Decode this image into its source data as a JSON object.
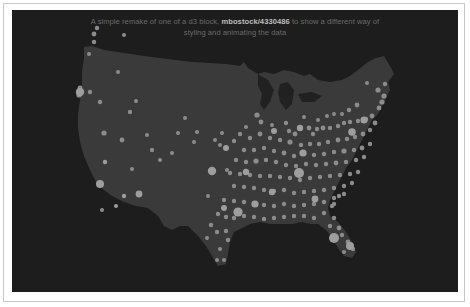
{
  "caption": {
    "before": "A simple remake of one of a d3 block, ",
    "link": "mbostock/4330486",
    "after": " to show a different way of",
    "line2": "styling and animating the data"
  },
  "colors": {
    "panel_bg": "#1d1d1d",
    "land": "#3a3a3a",
    "dot": "#8c8c8c",
    "dot_bright": "#9e9e9e",
    "caption_text": "#6a6a6a",
    "caption_link": "#bdbdbd"
  },
  "map": {
    "type": "hexbin-dot-map",
    "region": "United States (contiguous)",
    "dots": [
      [
        85,
        18,
        2.2
      ],
      [
        82,
        24,
        2.4
      ],
      [
        82,
        32,
        2.2
      ],
      [
        77,
        44,
        2.0
      ],
      [
        112,
        25,
        2.0
      ],
      [
        106,
        62,
        2.0
      ],
      [
        68,
        78,
        2.4
      ],
      [
        67,
        85,
        2.6
      ],
      [
        78,
        82,
        2.2
      ],
      [
        88,
        92,
        2.2
      ],
      [
        110,
        130,
        2.4
      ],
      [
        135,
        125,
        2.0
      ],
      [
        148,
        150,
        2.0
      ],
      [
        166,
        123,
        2.0
      ],
      [
        120,
        159,
        2.0
      ],
      [
        90,
        200,
        2.0
      ],
      [
        124,
        91,
        2.0
      ],
      [
        92,
        123,
        2.6
      ],
      [
        118,
        102,
        2.2
      ],
      [
        140,
        140,
        2.2
      ],
      [
        160,
        143,
        2.0
      ],
      [
        173,
        108,
        2.0
      ],
      [
        182,
        132,
        2.0
      ],
      [
        185,
        122,
        2.0
      ],
      [
        210,
        123,
        2.0
      ],
      [
        203,
        130,
        2.0
      ],
      [
        208,
        135,
        2.0
      ],
      [
        215,
        160,
        2.0
      ],
      [
        245,
        105,
        2.6
      ],
      [
        249,
        112,
        2.4
      ],
      [
        260,
        115,
        2.0
      ],
      [
        274,
        113,
        2.2
      ],
      [
        277,
        121,
        2.2
      ],
      [
        283,
        124,
        2.4
      ],
      [
        292,
        107,
        2.0
      ],
      [
        297,
        118,
        2.4
      ],
      [
        301,
        124,
        2.2
      ],
      [
        305,
        119,
        2.2
      ],
      [
        311,
        118,
        2.4
      ],
      [
        318,
        118,
        2.2
      ],
      [
        326,
        116,
        2.2
      ],
      [
        332,
        113,
        2.2
      ],
      [
        338,
        112,
        2.2
      ],
      [
        346,
        111,
        2.2
      ],
      [
        354,
        109,
        2.2
      ],
      [
        360,
        106,
        2.4
      ],
      [
        367,
        98,
        2.4
      ],
      [
        370,
        92,
        2.6
      ],
      [
        372,
        86,
        2.6
      ],
      [
        366,
        80,
        2.6
      ],
      [
        373,
        74,
        2.2
      ],
      [
        355,
        73,
        2.0
      ],
      [
        345,
        95,
        2.4
      ],
      [
        337,
        100,
        2.2
      ],
      [
        330,
        104,
        2.0
      ],
      [
        322,
        104,
        2.0
      ],
      [
        315,
        106,
        2.0
      ],
      [
        306,
        110,
        2.0
      ],
      [
        234,
        117,
        2.0
      ],
      [
        228,
        124,
        2.2
      ],
      [
        222,
        131,
        2.2
      ],
      [
        238,
        128,
        2.2
      ],
      [
        248,
        124,
        2.4
      ],
      [
        258,
        128,
        2.2
      ],
      [
        268,
        130,
        2.2
      ],
      [
        278,
        132,
        2.6
      ],
      [
        289,
        135,
        2.2
      ],
      [
        298,
        134,
        2.2
      ],
      [
        307,
        134,
        2.2
      ],
      [
        316,
        132,
        2.2
      ],
      [
        326,
        130,
        2.4
      ],
      [
        335,
        129,
        2.2
      ],
      [
        343,
        127,
        2.2
      ],
      [
        351,
        124,
        2.4
      ],
      [
        358,
        120,
        2.2
      ],
      [
        363,
        113,
        2.4
      ],
      [
        232,
        140,
        2.2
      ],
      [
        242,
        140,
        2.2
      ],
      [
        252,
        138,
        2.2
      ],
      [
        262,
        141,
        2.2
      ],
      [
        272,
        143,
        2.4
      ],
      [
        282,
        146,
        2.2
      ],
      [
        292,
        144,
        2.2
      ],
      [
        302,
        145,
        2.2
      ],
      [
        312,
        144,
        2.2
      ],
      [
        322,
        142,
        2.2
      ],
      [
        332,
        141,
        2.6
      ],
      [
        342,
        140,
        2.2
      ],
      [
        350,
        138,
        2.4
      ],
      [
        358,
        134,
        2.2
      ],
      [
        224,
        150,
        2.2
      ],
      [
        234,
        152,
        2.2
      ],
      [
        244,
        151,
        2.6
      ],
      [
        254,
        150,
        2.2
      ],
      [
        264,
        152,
        2.2
      ],
      [
        274,
        155,
        2.2
      ],
      [
        284,
        156,
        2.2
      ],
      [
        294,
        154,
        2.2
      ],
      [
        304,
        155,
        2.2
      ],
      [
        314,
        154,
        2.2
      ],
      [
        324,
        153,
        2.4
      ],
      [
        334,
        152,
        2.2
      ],
      [
        344,
        150,
        2.2
      ],
      [
        352,
        147,
        2.2
      ],
      [
        218,
        163,
        2.2
      ],
      [
        228,
        164,
        2.2
      ],
      [
        238,
        165,
        2.2
      ],
      [
        248,
        166,
        2.2
      ],
      [
        258,
        166,
        2.2
      ],
      [
        268,
        167,
        2.2
      ],
      [
        278,
        168,
        2.2
      ],
      [
        288,
        170,
        2.2
      ],
      [
        298,
        168,
        2.2
      ],
      [
        308,
        167,
        2.2
      ],
      [
        318,
        166,
        2.2
      ],
      [
        328,
        165,
        2.2
      ],
      [
        338,
        164,
        2.2
      ],
      [
        346,
        162,
        2.2
      ],
      [
        222,
        176,
        2.2
      ],
      [
        232,
        177,
        2.2
      ],
      [
        242,
        178,
        2.2
      ],
      [
        252,
        180,
        2.2
      ],
      [
        262,
        181,
        2.2
      ],
      [
        272,
        180,
        2.2
      ],
      [
        282,
        183,
        2.2
      ],
      [
        292,
        182,
        2.2
      ],
      [
        302,
        181,
        2.2
      ],
      [
        312,
        180,
        2.2
      ],
      [
        322,
        178,
        2.2
      ],
      [
        332,
        176,
        2.2
      ],
      [
        340,
        173,
        2.2
      ],
      [
        196,
        186,
        2.0
      ],
      [
        212,
        190,
        2.2
      ],
      [
        222,
        191,
        2.2
      ],
      [
        232,
        192,
        2.2
      ],
      [
        242,
        193,
        2.2
      ],
      [
        252,
        195,
        2.2
      ],
      [
        262,
        196,
        2.2
      ],
      [
        272,
        194,
        2.2
      ],
      [
        282,
        196,
        2.2
      ],
      [
        292,
        195,
        2.2
      ],
      [
        302,
        194,
        2.2
      ],
      [
        312,
        192,
        2.2
      ],
      [
        322,
        188,
        2.2
      ],
      [
        332,
        184,
        2.2
      ],
      [
        206,
        204,
        2.2
      ],
      [
        214,
        207,
        2.2
      ],
      [
        222,
        208,
        2.2
      ],
      [
        232,
        206,
        2.2
      ],
      [
        242,
        207,
        2.2
      ],
      [
        252,
        209,
        2.2
      ],
      [
        262,
        208,
        2.2
      ],
      [
        272,
        207,
        2.2
      ],
      [
        282,
        206,
        2.2
      ],
      [
        292,
        206,
        2.2
      ],
      [
        302,
        208,
        2.2
      ],
      [
        312,
        203,
        2.2
      ],
      [
        320,
        196,
        2.2
      ],
      [
        199,
        215,
        2.2
      ],
      [
        205,
        222,
        2.2
      ],
      [
        214,
        221,
        2.2
      ],
      [
        216,
        230,
        2.2
      ],
      [
        208,
        239,
        2.0
      ],
      [
        212,
        250,
        2.0
      ],
      [
        205,
        250,
        2.0
      ],
      [
        195,
        228,
        2.0
      ],
      [
        322,
        208,
        2.2
      ],
      [
        318,
        216,
        2.2
      ],
      [
        327,
        218,
        2.4
      ],
      [
        330,
        225,
        2.2
      ],
      [
        336,
        232,
        2.4
      ],
      [
        341,
        239,
        2.2
      ],
      [
        332,
        242,
        2.0
      ],
      [
        322,
        194,
        2.2
      ],
      [
        327,
        186,
        2.2
      ]
    ],
    "blobs": [
      [
        68,
        82,
        4.2
      ],
      [
        88,
        174,
        4.0
      ],
      [
        93,
        152,
        2.2
      ],
      [
        127,
        184,
        3.4
      ],
      [
        112,
        186,
        2.2
      ],
      [
        104,
        196,
        2.0
      ],
      [
        200,
        161,
        4.2
      ],
      [
        226,
        202,
        4.6
      ],
      [
        287,
        163,
        5.0
      ],
      [
        340,
        122,
        3.8
      ],
      [
        352,
        110,
        3.6
      ],
      [
        288,
        118,
        3.2
      ],
      [
        262,
        121,
        3.0
      ],
      [
        322,
        228,
        5.0
      ],
      [
        338,
        236,
        4.0
      ],
      [
        243,
        194,
        3.6
      ],
      [
        303,
        189,
        3.4
      ],
      [
        260,
        182,
        3.2
      ],
      [
        234,
        162,
        3.2
      ],
      [
        291,
        143,
        3.6
      ],
      [
        212,
        198,
        3.0
      ],
      [
        214,
        138,
        3.0
      ]
    ]
  }
}
